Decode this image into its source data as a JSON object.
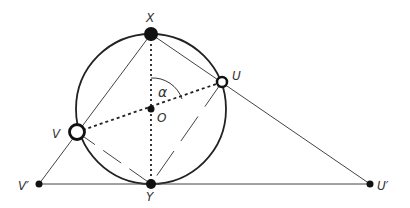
{
  "diagram": {
    "labels": {
      "X": "X",
      "Y": "Y",
      "O": "O",
      "U": "U",
      "V": "V",
      "U_prime": "U′",
      "V_prime": "V′",
      "angle": "α"
    },
    "points": {
      "X": [
        151,
        34
      ],
      "Y": [
        151,
        184
      ],
      "O": [
        151,
        109
      ],
      "U": [
        222,
        82
      ],
      "V": [
        77,
        132
      ],
      "U_prime": [
        370,
        184
      ],
      "V_prime": [
        39,
        184
      ]
    },
    "circle": {
      "center": "O",
      "radius": 75
    },
    "colors": {
      "stroke": "#222222",
      "fill": "#111111",
      "background": "#ffffff"
    }
  }
}
